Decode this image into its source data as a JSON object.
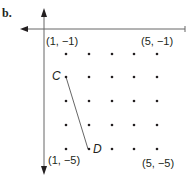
{
  "figure": {
    "label": "b.",
    "grid": {
      "x_range": [
        1,
        5
      ],
      "y_range": [
        -1,
        -5
      ],
      "columns_px": [
        66,
        89,
        112,
        134,
        157
      ],
      "rows_px": [
        54,
        77,
        101,
        125,
        149
      ]
    },
    "corner_labels": [
      {
        "text": "(1, −1)",
        "x": 1,
        "y": -1
      },
      {
        "text": "(5, −1)",
        "x": 5,
        "y": -1
      },
      {
        "text": "(1, −5)",
        "x": 1,
        "y": -5
      },
      {
        "text": "(5, −5)",
        "x": 5,
        "y": -5
      }
    ],
    "points": [
      {
        "name": "C",
        "x": 1,
        "y": -2
      },
      {
        "name": "D",
        "x": 2,
        "y": -5
      }
    ],
    "segment": {
      "from": "C",
      "to": "D"
    },
    "colors": {
      "ink": "#231f20",
      "axis": "#555555"
    }
  }
}
